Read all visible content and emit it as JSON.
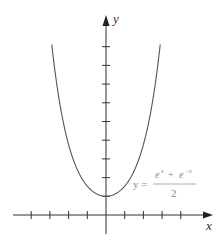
{
  "chart_data": {
    "type": "line",
    "title": "",
    "function": "y = (e^x + e^-x)/2",
    "xlabel": "x",
    "ylabel": "y",
    "xlim": [
      -5,
      5.6
    ],
    "ylim": [
      -1,
      9.5
    ],
    "x_ticks": [
      -4,
      -3,
      -2,
      -1,
      1,
      2,
      3,
      4
    ],
    "y_ticks": [
      1,
      2,
      3,
      4,
      5,
      6,
      7,
      8,
      9
    ],
    "tick_labels_shown": false,
    "grid": false,
    "series": [
      {
        "name": "cosh x",
        "x": [
          -2.9,
          -2.5,
          -2,
          -1.5,
          -1,
          -0.5,
          0,
          0.5,
          1,
          1.5,
          2,
          2.5,
          2.9
        ],
        "values": [
          9.1,
          6.13,
          3.76,
          2.35,
          1.54,
          1.13,
          1.0,
          1.13,
          1.54,
          2.35,
          3.76,
          6.13,
          9.1
        ]
      }
    ],
    "annotations": [
      {
        "text": "y = (e^x + e^-x)/2",
        "position": "right of curve near y=1.5"
      }
    ]
  },
  "labels": {
    "x_axis": "x",
    "y_axis": "y",
    "formula_lhs": "y =",
    "formula_num_a": "e",
    "formula_num_a_exp": "x",
    "formula_plus": "+",
    "formula_num_b": "e",
    "formula_num_b_exp": "−x",
    "formula_den": "2"
  },
  "colors": {
    "axis": "#333333",
    "curve": "#555555",
    "formula": "#8a8a8a"
  }
}
